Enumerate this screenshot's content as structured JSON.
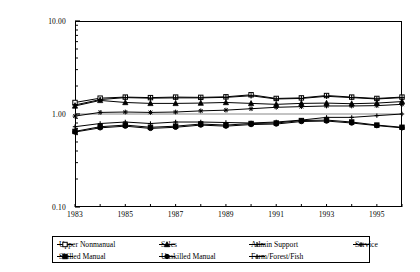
{
  "chart_data": {
    "type": "line",
    "title": "",
    "xlabel": "",
    "ylabel": "",
    "yscale": "log",
    "ylim": [
      0.1,
      10.0
    ],
    "ytick_labels": [
      "10.00",
      "1.00",
      "0.10"
    ],
    "ytick_values": [
      10.0,
      1.0,
      0.1
    ],
    "grid": false,
    "legend_position": "bottom",
    "x": [
      1983,
      1984,
      1985,
      1986,
      1987,
      1988,
      1989,
      1990,
      1991,
      1992,
      1993,
      1994,
      1995,
      1996
    ],
    "xtick_labels": [
      "1983",
      "1985",
      "1987",
      "1989",
      "1991",
      "1993",
      "1995"
    ],
    "xtick_values": [
      1983,
      1985,
      1987,
      1989,
      1991,
      1993,
      1995
    ],
    "series": [
      {
        "name": "Upper Nonmanual",
        "marker": "open-square",
        "values": [
          1.33,
          1.48,
          1.52,
          1.5,
          1.52,
          1.51,
          1.53,
          1.61,
          1.47,
          1.49,
          1.58,
          1.52,
          1.47,
          1.52
        ]
      },
      {
        "name": "Sales",
        "marker": "filled-triangle",
        "values": [
          1.22,
          1.4,
          1.33,
          1.3,
          1.3,
          1.31,
          1.33,
          1.3,
          1.27,
          1.3,
          1.31,
          1.29,
          1.31,
          1.36
        ]
      },
      {
        "name": "Admin Support",
        "marker": "plus",
        "values": [
          1.25,
          1.43,
          1.5,
          1.48,
          1.49,
          1.49,
          1.51,
          1.57,
          1.45,
          1.47,
          1.55,
          1.5,
          1.45,
          1.5
        ]
      },
      {
        "name": "Service",
        "marker": "star",
        "values": [
          0.95,
          1.04,
          1.05,
          1.04,
          1.05,
          1.08,
          1.1,
          1.14,
          1.18,
          1.2,
          1.22,
          1.22,
          1.23,
          1.27
        ]
      },
      {
        "name": "Skilled Manual",
        "marker": "filled-square",
        "values": [
          0.65,
          0.73,
          0.76,
          0.72,
          0.74,
          0.78,
          0.76,
          0.79,
          0.8,
          0.85,
          0.86,
          0.82,
          0.76,
          0.72
        ]
      },
      {
        "name": "Unskilled Manual",
        "marker": "filled-circle",
        "values": [
          0.64,
          0.71,
          0.74,
          0.7,
          0.72,
          0.76,
          0.74,
          0.77,
          0.78,
          0.83,
          0.84,
          0.8,
          0.75,
          0.71
        ]
      },
      {
        "name": "Farm/Forest/Fish",
        "marker": "small-plus",
        "values": [
          0.73,
          0.79,
          0.82,
          0.79,
          0.82,
          0.82,
          0.81,
          0.8,
          0.82,
          0.86,
          0.92,
          0.92,
          0.96,
          1.0
        ]
      }
    ]
  },
  "axes": {
    "y_labels": [
      "10.00",
      "1.00",
      "0.10"
    ],
    "x_labels": [
      "1983",
      "1985",
      "1987",
      "1989",
      "1991",
      "1993",
      "1995"
    ]
  },
  "legend": {
    "entries": [
      {
        "label": "Upper Nonmanual",
        "marker": "open-square"
      },
      {
        "label": "Sales",
        "marker": "filled-triangle"
      },
      {
        "label": "Admin Support",
        "marker": "plus"
      },
      {
        "label": "Service",
        "marker": "star"
      },
      {
        "label": "Skilled Manual",
        "marker": "filled-square"
      },
      {
        "label": "Unskilled Manual",
        "marker": "filled-circle"
      },
      {
        "label": "Farm/Forest/Fish",
        "marker": "small-plus"
      }
    ]
  }
}
